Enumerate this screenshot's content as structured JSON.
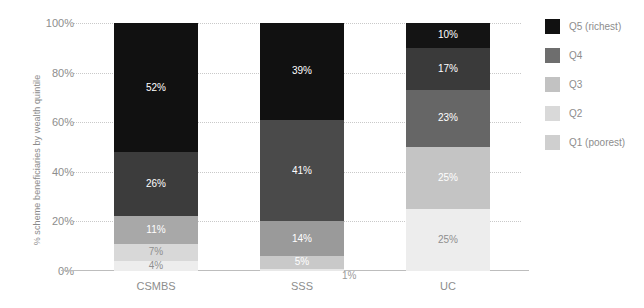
{
  "chart_data": {
    "type": "bar",
    "subtype": "stacked-bar-100",
    "title": "",
    "xlabel": "",
    "ylabel": "% scheme beneficiaries by wealth quintile",
    "ylim": [
      0,
      100
    ],
    "ytick_labels": [
      "0%",
      "20%",
      "40%",
      "60%",
      "80%",
      "100%"
    ],
    "ytick_values": [
      0,
      20,
      40,
      60,
      80,
      100
    ],
    "grid": true,
    "legend_position": "right",
    "categories": [
      "CSMBS",
      "SSS",
      "UC"
    ],
    "series": [
      {
        "name": "Q1 (poorest)",
        "color": "#ededed",
        "values": [
          4,
          1,
          25
        ],
        "labels": [
          "4%",
          "1%",
          "25%"
        ]
      },
      {
        "name": "Q2",
        "color": "#d4d4d4",
        "values": [
          7,
          5,
          25
        ],
        "labels": [
          "7%",
          "5%",
          "25%"
        ]
      },
      {
        "name": "Q3",
        "color": "#b0b0b0",
        "values": [
          11,
          14,
          23
        ],
        "labels": [
          "11%",
          "14%",
          "23%"
        ]
      },
      {
        "name": "Q4",
        "color": "#6e6e6e",
        "values": [
          26,
          41,
          17
        ],
        "labels": [
          "26%",
          "41%",
          "17%"
        ]
      },
      {
        "name": "Q5 (richest)",
        "color": "#3a3a3a",
        "values": [
          52,
          39,
          10
        ],
        "labels": [
          "52%",
          "39%",
          "10%"
        ]
      }
    ],
    "legend_entries": [
      {
        "label": "Q5 (richest)",
        "color": "#111111"
      },
      {
        "label": "Q4",
        "color": "#6e6e6e"
      },
      {
        "label": "Q3",
        "color": "#c2c2c2"
      },
      {
        "label": "Q2",
        "color": "#d9d9d9"
      },
      {
        "label": "Q1 (poorest)",
        "color": "#cfcfcf"
      }
    ],
    "segment_colors": {
      "CSMBS": {
        "Q1": "#ededed",
        "Q2": "#d8d8d8",
        "Q3": "#a8a8a8",
        "Q4": "#3c3c3c",
        "Q5": "#111111"
      },
      "SSS": {
        "Q1": "#e8e8e8",
        "Q2": "#c9c9c9",
        "Q3": "#9a9a9a",
        "Q4": "#4a4a4a",
        "Q5": "#111111"
      },
      "UC": {
        "Q1": "#ededed",
        "Q2": "#c4c4c4",
        "Q3": "#666666",
        "Q4": "#3a3a3a",
        "Q5": "#141414"
      }
    },
    "label_text_colors": {
      "CSMBS": {
        "Q1": "#8f8f8f",
        "Q2": "#8f8f8f",
        "Q3": "#ffffff",
        "Q4": "#ffffff",
        "Q5": "#ffffff"
      },
      "SSS": {
        "Q1": "#9a9a9a",
        "Q2": "#ffffff",
        "Q3": "#ffffff",
        "Q4": "#ffffff",
        "Q5": "#ffffff"
      },
      "UC": {
        "Q1": "#8f8f8f",
        "Q2": "#ffffff",
        "Q3": "#ffffff",
        "Q4": "#ffffff",
        "Q5": "#ffffff"
      }
    }
  }
}
